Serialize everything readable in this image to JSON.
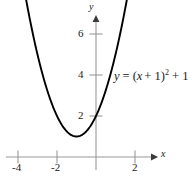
{
  "figure": {
    "background_color": "#ffffff",
    "curve_color": "#000000",
    "axis_color": "#9a9a9a",
    "text_color": "#1a1a1a"
  },
  "axes": {
    "x_name": "x",
    "y_name": "y"
  },
  "equation": {
    "lhs": "y",
    "equals": "=",
    "open_paren": "(",
    "var": "x",
    "plus1": "+ 1",
    "close_paren": ")",
    "exponent": "2",
    "tail": "+ 1",
    "full_text": "y = (x + 1)^2 + 1"
  },
  "chart_data": {
    "type": "line",
    "title": "",
    "xlabel": "x",
    "ylabel": "y",
    "equation": "y = (x + 1)^2 + 1",
    "xlim": [
      -4.9,
      2.9
    ],
    "ylim": [
      -0.9,
      7.2
    ],
    "xticks": [
      -4,
      -2,
      2
    ],
    "xtick_labels": [
      "-4",
      "-2",
      "2"
    ],
    "yticks": [
      2,
      4,
      6
    ],
    "ytick_labels": [
      "2",
      "4",
      "6"
    ],
    "grid": false,
    "legend": "none",
    "vertex": [
      -1,
      1
    ],
    "y_intercept": [
      0,
      2
    ],
    "x_domain_drawn": [
      -4.4,
      2.2
    ],
    "arrowheads": [
      "left-end-up",
      "right-end-up"
    ],
    "series": [
      {
        "name": "y = (x + 1)^2 + 1",
        "x": [
          -4.4,
          -4.0,
          -3.5,
          -3.0,
          -2.5,
          -2.0,
          -1.5,
          -1.0,
          -0.5,
          0.0,
          0.5,
          1.0,
          1.5,
          2.0,
          2.2
        ],
        "values": [
          12.56,
          10.0,
          7.25,
          5.0,
          3.25,
          2.0,
          1.25,
          1.0,
          1.25,
          2.0,
          3.25,
          5.0,
          7.25,
          10.0,
          11.24
        ]
      }
    ]
  }
}
